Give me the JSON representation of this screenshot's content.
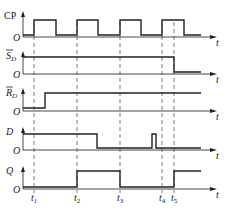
{
  "diagram": {
    "time_axis_label": "t",
    "origin_label": "O",
    "time_markers": [
      {
        "label": "t",
        "sub": "1",
        "x": 34
      },
      {
        "label": "t",
        "sub": "2",
        "x": 77
      },
      {
        "label": "t",
        "sub": "3",
        "x": 120
      },
      {
        "label": "t",
        "sub": "4",
        "x": 162
      },
      {
        "label": "t",
        "sub": "5",
        "x": 174
      }
    ],
    "signals": [
      {
        "name": "CP",
        "overbar": false,
        "italic": false,
        "base_y": 37,
        "high_y": 20,
        "low_y": 35,
        "points": [
          [
            23,
            35
          ],
          [
            34,
            35
          ],
          [
            34,
            20
          ],
          [
            56,
            20
          ],
          [
            56,
            35
          ],
          [
            77,
            35
          ],
          [
            77,
            20
          ],
          [
            98,
            20
          ],
          [
            98,
            35
          ],
          [
            120,
            35
          ],
          [
            120,
            20
          ],
          [
            141,
            20
          ],
          [
            141,
            35
          ],
          [
            162,
            35
          ],
          [
            162,
            20
          ],
          [
            184,
            20
          ],
          [
            184,
            35
          ],
          [
            201,
            35
          ]
        ]
      },
      {
        "name": "S",
        "sub": "D",
        "overbar": true,
        "italic": false,
        "base_y": 74,
        "points": [
          [
            23,
            57
          ],
          [
            174,
            57
          ],
          [
            174,
            72
          ],
          [
            201,
            72
          ]
        ]
      },
      {
        "name": "R",
        "sub": "D",
        "overbar": true,
        "italic": false,
        "base_y": 111,
        "points": [
          [
            23,
            108
          ],
          [
            45,
            108
          ],
          [
            45,
            93
          ],
          [
            201,
            93
          ]
        ]
      },
      {
        "name": "D",
        "overbar": false,
        "italic": true,
        "base_y": 150,
        "points": [
          [
            23,
            134
          ],
          [
            97,
            134
          ],
          [
            97,
            148
          ],
          [
            152,
            148
          ],
          [
            152,
            134
          ],
          [
            156,
            134
          ],
          [
            156,
            148
          ],
          [
            201,
            148
          ]
        ]
      },
      {
        "name": "Q",
        "overbar": false,
        "italic": true,
        "base_y": 189,
        "points": [
          [
            23,
            187
          ],
          [
            77,
            187
          ],
          [
            77,
            171
          ],
          [
            120,
            171
          ],
          [
            120,
            187
          ],
          [
            174,
            187
          ],
          [
            174,
            171
          ],
          [
            201,
            171
          ]
        ]
      }
    ]
  }
}
